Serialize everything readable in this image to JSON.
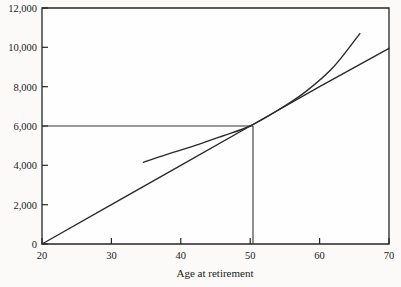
{
  "chart_data": {
    "type": "line",
    "title": "",
    "xlabel": "Age at retirement",
    "ylabel": "",
    "xlim": [
      20,
      70
    ],
    "ylim": [
      0,
      12000
    ],
    "x_ticks": [
      20,
      30,
      40,
      50,
      60,
      70
    ],
    "x_tick_labels": [
      "20",
      "30",
      "40",
      "50",
      "60",
      "70"
    ],
    "y_ticks": [
      0,
      2000,
      4000,
      6000,
      8000,
      10000,
      12000
    ],
    "y_tick_labels": [
      "0",
      "2,000",
      "4,000",
      "6,000",
      "8,000",
      "10,000",
      "12,000"
    ],
    "grid": false,
    "legend": null,
    "series": [
      {
        "name": "straight-line-through-origin",
        "style": "solid",
        "color": "#2b2b2b",
        "points": [
          [
            20,
            0
          ],
          [
            30,
            2000
          ],
          [
            40,
            4000
          ],
          [
            50,
            6000
          ],
          [
            60,
            8000
          ],
          [
            70,
            9950
          ]
        ]
      },
      {
        "name": "curved-benefit-line",
        "style": "solid",
        "color": "#2b2b2b",
        "points": [
          [
            34.6,
            4150
          ],
          [
            38,
            4560
          ],
          [
            42,
            5000
          ],
          [
            46,
            5490
          ],
          [
            50,
            6000
          ],
          [
            54,
            6800
          ],
          [
            58,
            7750
          ],
          [
            62,
            9000
          ],
          [
            65.8,
            10700
          ]
        ]
      }
    ],
    "reference_lines": [
      {
        "name": "horizontal-6000-line",
        "orientation": "horizontal",
        "value": 6000,
        "from": 20,
        "to": 50
      },
      {
        "name": "vertical-age-50-line",
        "orientation": "vertical",
        "value": 50,
        "from": 0,
        "to": 6000
      }
    ],
    "annotations": [
      {
        "name": "tangency-point",
        "x": 50,
        "y": 6000
      }
    ]
  }
}
